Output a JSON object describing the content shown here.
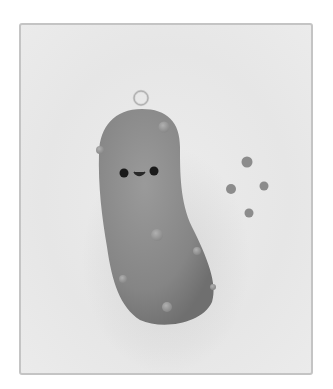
{
  "image": {
    "subject": "clay pickle charm with smiling face",
    "style": "grayscale photograph",
    "colors": {
      "background": "#e8e8e8",
      "frame_border": "#c4c4c4",
      "pickle_body": "#8a8a8a",
      "bumps": "#9a9a9a",
      "eyes": "#1a1a1a",
      "ring": "#d0d0d0"
    },
    "elements": [
      "metal jump ring",
      "pickle body",
      "face",
      "bumps",
      "loose clay dots"
    ]
  }
}
